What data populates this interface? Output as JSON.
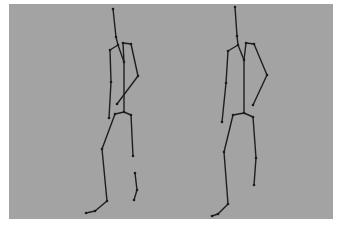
{
  "figure": {
    "background_color": "#a3a3a3",
    "line_color": "#1e1e1e",
    "skeletons": [
      {
        "name": "skeleton-left",
        "joints": {
          "head": [
            113,
            9
          ],
          "neck": [
            116,
            37
          ],
          "shoulder_center": [
            118,
            45
          ],
          "l_shoulder": [
            110,
            50
          ],
          "r_shoulder_a": [
            123,
            43
          ],
          "r_shoulder": [
            131,
            44
          ],
          "chest": [
            124,
            62
          ],
          "r_elbow": [
            138,
            76
          ],
          "r_hand": [
            117,
            104
          ],
          "l_elbow": [
            111,
            82
          ],
          "l_hand": [
            109,
            118
          ],
          "pelvis": [
            124,
            112
          ],
          "l_hip": [
            115,
            114
          ],
          "r_hip": [
            131,
            115
          ],
          "l_knee": [
            102,
            149
          ],
          "l_ankle": [
            107,
            201
          ],
          "l_foot": [
            95,
            211
          ],
          "l_toe": [
            86,
            213
          ],
          "r_knee": [
            133,
            156
          ],
          "r_shin_a": [
            135,
            173
          ],
          "r_shin_b": [
            137,
            190
          ],
          "r_ankle": [
            134,
            200
          ]
        },
        "bones": [
          [
            "head",
            "neck"
          ],
          [
            "neck",
            "shoulder_center"
          ],
          [
            "shoulder_center",
            "l_shoulder"
          ],
          [
            "shoulder_center",
            "chest"
          ],
          [
            "r_shoulder_a",
            "r_shoulder"
          ],
          [
            "r_shoulder_a",
            "chest"
          ],
          [
            "r_shoulder",
            "r_elbow"
          ],
          [
            "r_elbow",
            "r_hand"
          ],
          [
            "l_shoulder",
            "l_elbow"
          ],
          [
            "l_elbow",
            "l_hand"
          ],
          [
            "chest",
            "pelvis"
          ],
          [
            "pelvis",
            "l_hip"
          ],
          [
            "pelvis",
            "r_hip"
          ],
          [
            "l_hip",
            "l_knee"
          ],
          [
            "l_knee",
            "l_ankle"
          ],
          [
            "l_ankle",
            "l_foot"
          ],
          [
            "l_foot",
            "l_toe"
          ],
          [
            "r_hip",
            "r_knee"
          ],
          [
            "r_shin_a",
            "r_shin_b"
          ],
          [
            "r_shin_b",
            "r_ankle"
          ]
        ]
      },
      {
        "name": "skeleton-right",
        "joints": {
          "head": [
            235,
            7
          ],
          "neck": [
            237,
            36
          ],
          "shoulder_center": [
            238,
            45
          ],
          "l_shoulder": [
            228,
            51
          ],
          "r_shoulder_a": [
            246,
            43
          ],
          "r_shoulder": [
            254,
            44
          ],
          "chest": [
            244,
            60
          ],
          "r_elbow": [
            267,
            75
          ],
          "r_hand": [
            253,
            105
          ],
          "l_elbow": [
            226,
            83
          ],
          "l_hand": [
            222,
            122
          ],
          "pelvis": [
            244,
            113
          ],
          "l_hip": [
            233,
            115
          ],
          "r_hip": [
            253,
            117
          ],
          "l_knee": [
            224,
            152
          ],
          "l_ankle": [
            228,
            204
          ],
          "l_foot": [
            218,
            214
          ],
          "l_toe": [
            212,
            216
          ],
          "r_knee": [
            256,
            158
          ],
          "r_ankle": [
            254,
            185
          ]
        },
        "bones": [
          [
            "head",
            "neck"
          ],
          [
            "neck",
            "shoulder_center"
          ],
          [
            "shoulder_center",
            "l_shoulder"
          ],
          [
            "shoulder_center",
            "chest"
          ],
          [
            "r_shoulder_a",
            "r_shoulder"
          ],
          [
            "r_shoulder_a",
            "chest"
          ],
          [
            "r_shoulder",
            "r_elbow"
          ],
          [
            "r_elbow",
            "r_hand"
          ],
          [
            "l_shoulder",
            "l_elbow"
          ],
          [
            "l_elbow",
            "l_hand"
          ],
          [
            "chest",
            "pelvis"
          ],
          [
            "pelvis",
            "l_hip"
          ],
          [
            "pelvis",
            "r_hip"
          ],
          [
            "l_hip",
            "l_knee"
          ],
          [
            "l_knee",
            "l_ankle"
          ],
          [
            "l_ankle",
            "l_foot"
          ],
          [
            "l_foot",
            "l_toe"
          ],
          [
            "r_hip",
            "r_knee"
          ],
          [
            "r_knee",
            "r_ankle"
          ]
        ]
      }
    ]
  }
}
